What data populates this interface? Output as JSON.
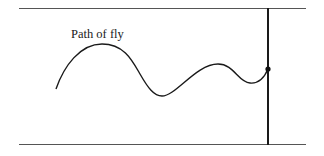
{
  "diagram": {
    "label": "Path of fly",
    "elements": {
      "top_wall": "horizontal line",
      "bottom_wall": "horizontal line",
      "vertical_line": "thick vertical line",
      "fly_path": "wavy curve",
      "endpoint": "dot on vertical line"
    },
    "colors": {
      "stroke": "#1a1a1a",
      "wall": "#555555",
      "background": "#ffffff"
    }
  }
}
